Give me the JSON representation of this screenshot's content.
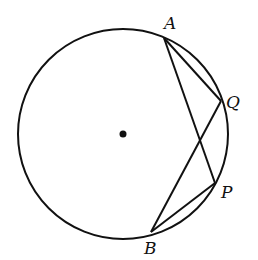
{
  "diagram": {
    "type": "circle-geometry",
    "circle": {
      "cx": 123,
      "cy": 134,
      "r": 105,
      "center_marked": true
    },
    "points": [
      {
        "id": "A",
        "label": "A",
        "x": 164,
        "y": 38,
        "label_x": 164,
        "label_y": 29
      },
      {
        "id": "Q",
        "label": "Q",
        "x": 221,
        "y": 101,
        "label_x": 226,
        "label_y": 108
      },
      {
        "id": "P",
        "label": "P",
        "x": 215,
        "y": 183,
        "label_x": 221,
        "label_y": 198
      },
      {
        "id": "B",
        "label": "B",
        "x": 151,
        "y": 232,
        "label_x": 144,
        "label_y": 254
      }
    ],
    "segments": [
      {
        "from": "A",
        "to": "Q"
      },
      {
        "from": "A",
        "to": "P"
      },
      {
        "from": "Q",
        "to": "B"
      },
      {
        "from": "P",
        "to": "B"
      }
    ],
    "colors": {
      "stroke": "#111111",
      "background": "#ffffff"
    }
  }
}
